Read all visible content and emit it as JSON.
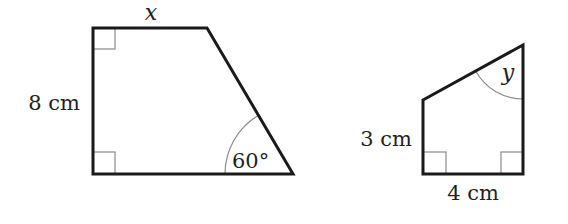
{
  "figures": [
    {
      "name": "trapezium",
      "labels": {
        "top_side": "x",
        "left_side": "8 cm",
        "bottom_right_angle": "60°"
      },
      "right_angles": 2
    },
    {
      "name": "right-trapezium",
      "labels": {
        "top_right_angle": "y",
        "left_side": "3 cm",
        "bottom_side": "4 cm"
      },
      "right_angles": 2
    }
  ],
  "colors": {
    "outline": "#1a1a1a",
    "marker": "#8a8a8a",
    "text": "#231f20"
  }
}
